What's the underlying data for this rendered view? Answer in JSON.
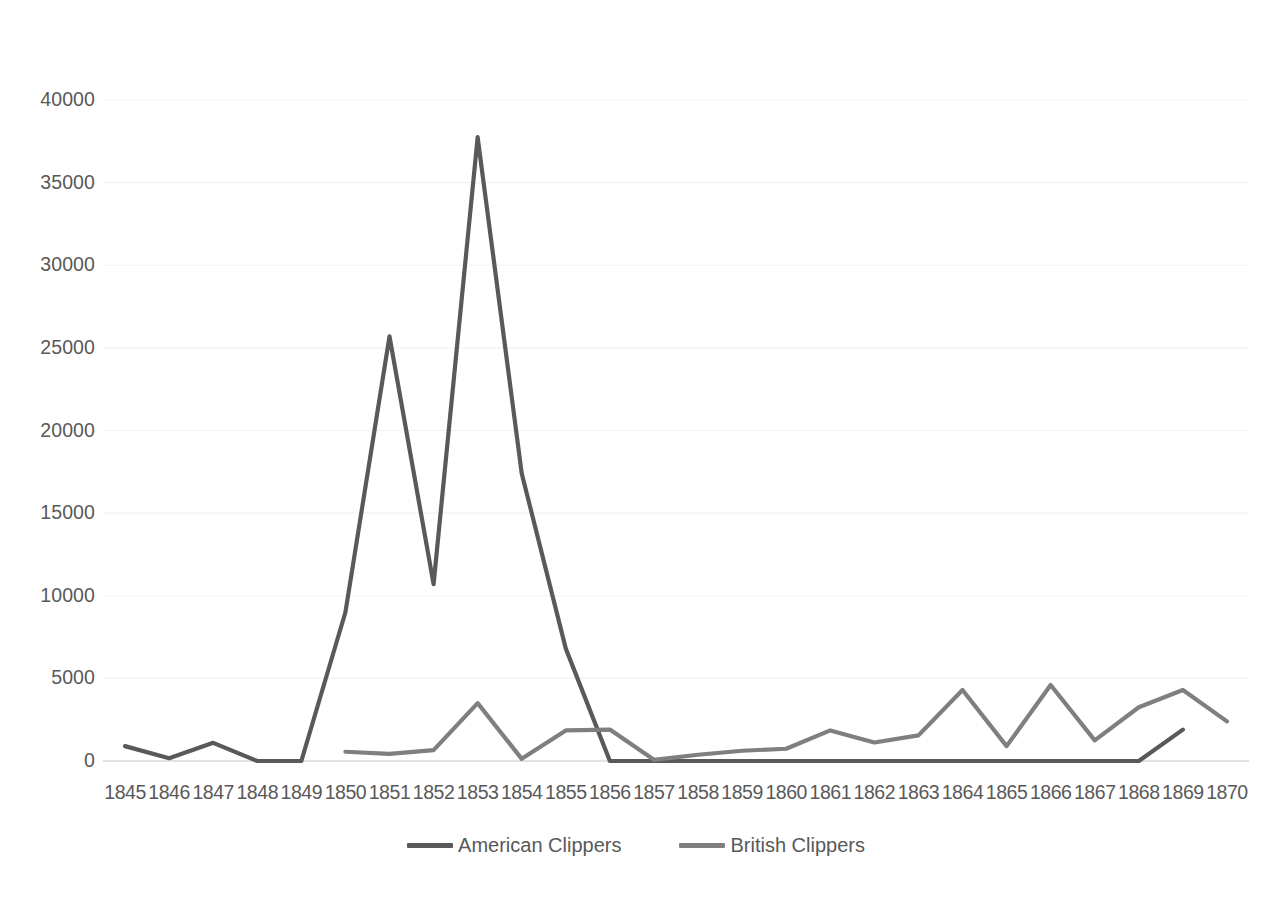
{
  "chart_data": {
    "type": "line",
    "title": "",
    "xlabel": "",
    "ylabel": "",
    "categories": [
      "1845",
      "1846",
      "1847",
      "1848",
      "1849",
      "1850",
      "1851",
      "1852",
      "1853",
      "1854",
      "1855",
      "1856",
      "1857",
      "1858",
      "1859",
      "1860",
      "1861",
      "1862",
      "1863",
      "1864",
      "1865",
      "1866",
      "1867",
      "1868",
      "1869",
      "1870"
    ],
    "series": [
      {
        "name": "American Clippers",
        "color": "#595959",
        "values": [
          900,
          170,
          1100,
          0,
          0,
          9000,
          25700,
          10700,
          37750,
          17400,
          6800,
          0,
          0,
          0,
          0,
          0,
          0,
          0,
          0,
          0,
          0,
          0,
          0,
          0,
          1900,
          null
        ]
      },
      {
        "name": "British Clippers",
        "color": "#7f7f7f",
        "values": [
          null,
          null,
          null,
          null,
          null,
          560,
          430,
          660,
          3500,
          130,
          1850,
          1900,
          70,
          380,
          620,
          740,
          1850,
          1120,
          1550,
          4300,
          900,
          4600,
          1250,
          3250,
          4300,
          2400
        ]
      }
    ],
    "ylim": [
      0,
      40000
    ],
    "yticks": [
      0,
      5000,
      10000,
      15000,
      20000,
      25000,
      30000,
      35000,
      40000
    ],
    "ytick_labels": [
      "0",
      "5000",
      "10000",
      "15000",
      "20000",
      "25000",
      "30000",
      "35000",
      "40000"
    ],
    "grid": true,
    "grid_color": "#f2f2f2",
    "axis_color": "#d9d9d9",
    "legend_position": "bottom"
  },
  "legend": {
    "items": [
      {
        "label": "American Clippers",
        "color": "#595959"
      },
      {
        "label": "British Clippers",
        "color": "#7f7f7f"
      }
    ]
  }
}
